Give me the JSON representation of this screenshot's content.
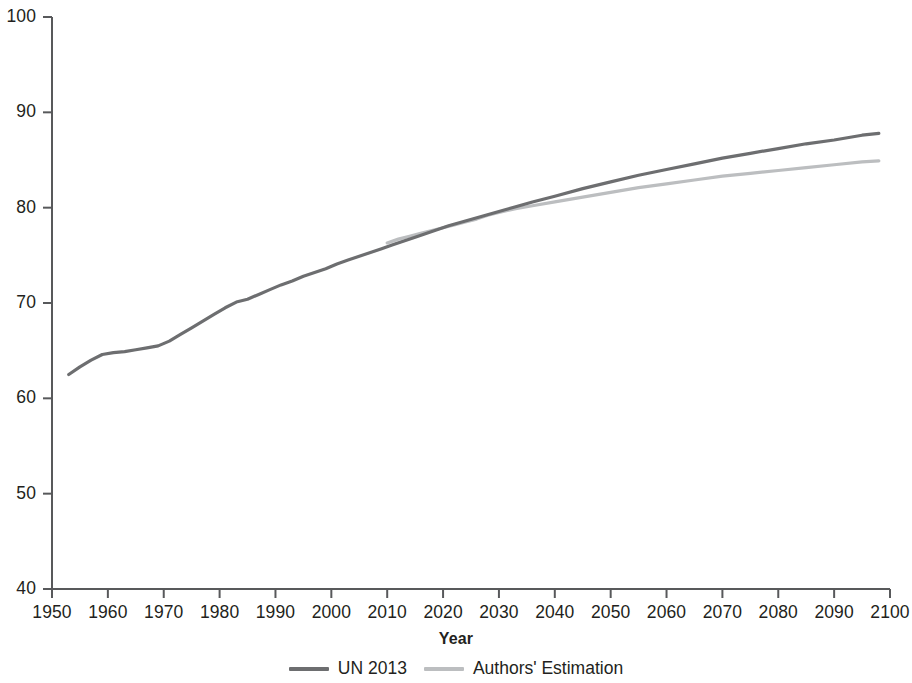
{
  "chart_data": {
    "type": "line",
    "title": "",
    "xlabel": "Year",
    "ylabel": "",
    "xlim": [
      1950,
      2100
    ],
    "ylim": [
      40,
      100
    ],
    "grid": false,
    "legend_position": "bottom-center",
    "xticks": [
      "1950",
      "1960",
      "1970",
      "1980",
      "1990",
      "2000",
      "2010",
      "2020",
      "2030",
      "2040",
      "2050",
      "2060",
      "2070",
      "2080",
      "2090",
      "2100"
    ],
    "yticks": [
      "40",
      "50",
      "60",
      "70",
      "80",
      "90",
      "100"
    ],
    "colors": {
      "un_2013": "#6d6e70",
      "authors_estimation": "#bcbec0"
    },
    "series": [
      {
        "name": "UN 2013",
        "color": "#6d6e70",
        "x": [
          1953,
          1955,
          1957,
          1959,
          1961,
          1963,
          1965,
          1967,
          1969,
          1971,
          1973,
          1975,
          1977,
          1979,
          1981,
          1983,
          1985,
          1987,
          1989,
          1991,
          1993,
          1995,
          1997,
          1999,
          2001,
          2003,
          2005,
          2007,
          2009,
          2011,
          2013,
          2015,
          2018,
          2021,
          2024,
          2027,
          2030,
          2033,
          2036,
          2040,
          2045,
          2050,
          2055,
          2060,
          2065,
          2070,
          2075,
          2080,
          2085,
          2090,
          2095,
          2098
        ],
        "y": [
          62.5,
          63.3,
          64.0,
          64.6,
          64.8,
          64.9,
          65.1,
          65.3,
          65.5,
          66.0,
          66.7,
          67.4,
          68.1,
          68.8,
          69.5,
          70.1,
          70.4,
          70.9,
          71.4,
          71.9,
          72.3,
          72.8,
          73.2,
          73.6,
          74.1,
          74.5,
          74.9,
          75.3,
          75.7,
          76.1,
          76.5,
          76.9,
          77.5,
          78.1,
          78.6,
          79.1,
          79.6,
          80.1,
          80.6,
          81.2,
          82.0,
          82.7,
          83.4,
          84.0,
          84.6,
          85.2,
          85.7,
          86.2,
          86.7,
          87.1,
          87.6,
          87.8
        ]
      },
      {
        "name": "Authors' Estimation",
        "color": "#bcbec0",
        "x": [
          2010,
          2012,
          2014,
          2016,
          2018,
          2020,
          2022,
          2024,
          2026,
          2028,
          2030,
          2033,
          2036,
          2040,
          2045,
          2050,
          2055,
          2060,
          2065,
          2070,
          2075,
          2080,
          2085,
          2090,
          2095,
          2098
        ],
        "y": [
          76.3,
          76.7,
          77.0,
          77.3,
          77.6,
          77.9,
          78.2,
          78.5,
          78.8,
          79.2,
          79.5,
          79.9,
          80.2,
          80.6,
          81.1,
          81.6,
          82.1,
          82.5,
          82.9,
          83.3,
          83.6,
          83.9,
          84.2,
          84.5,
          84.8,
          84.9
        ]
      }
    ]
  },
  "axis": {
    "title": "Year"
  },
  "legend": {
    "items": [
      {
        "label": "UN 2013"
      },
      {
        "label": "Authors' Estimation"
      }
    ]
  }
}
